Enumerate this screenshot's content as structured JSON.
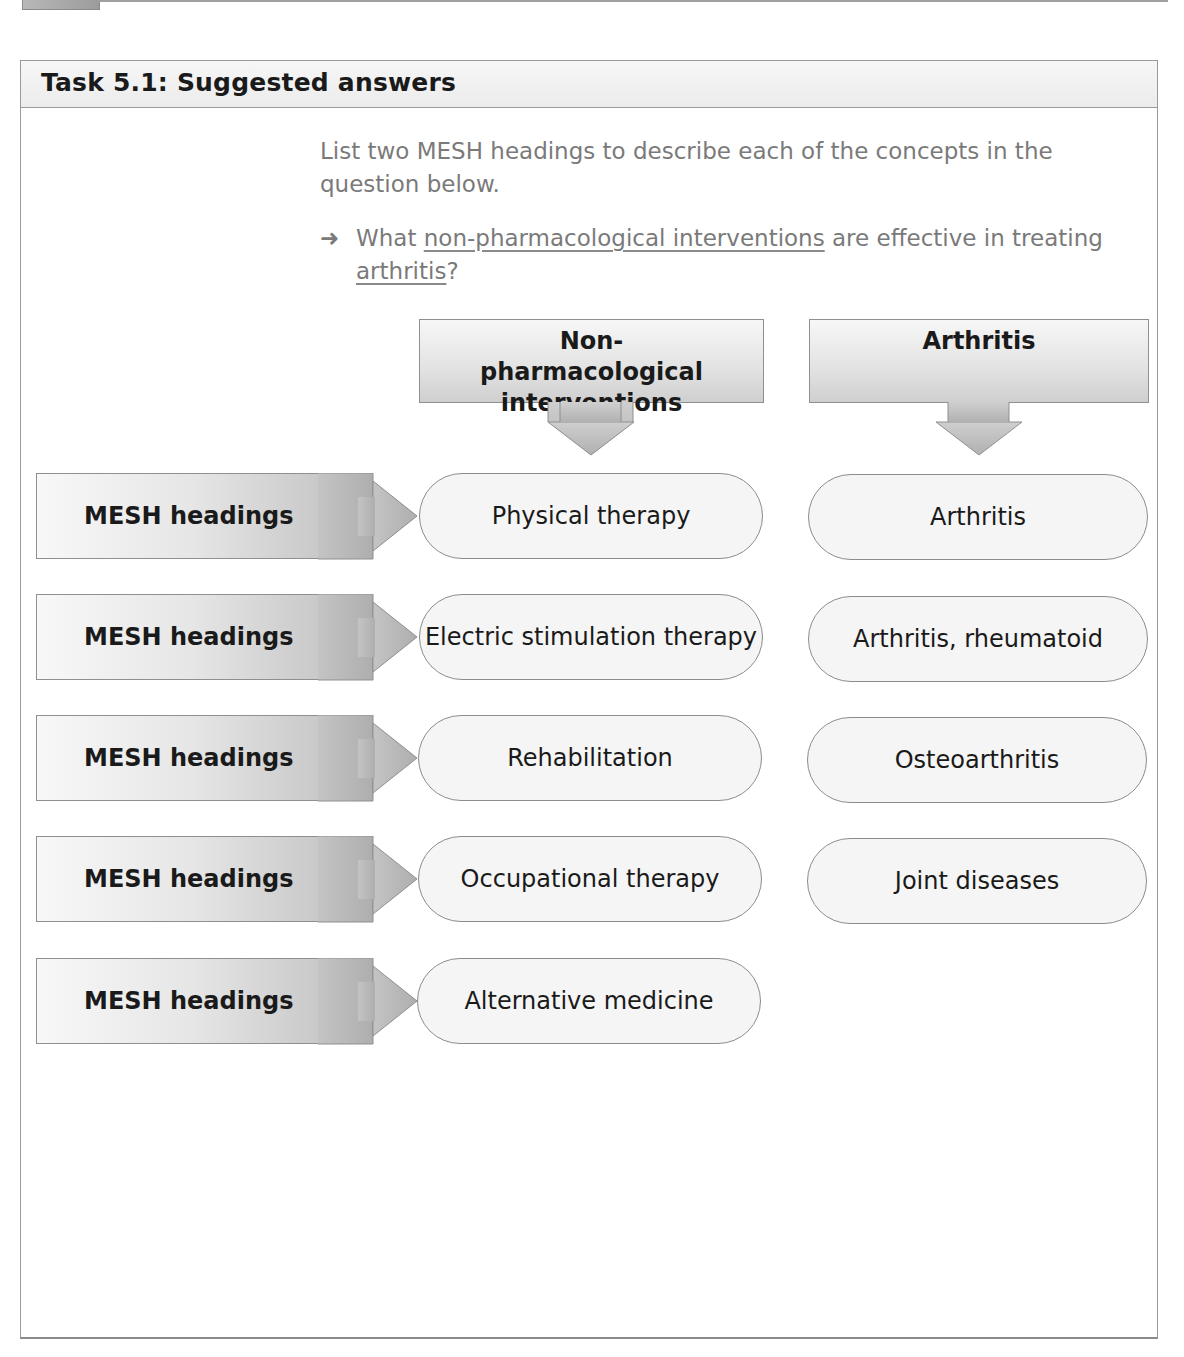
{
  "panel": {
    "title": "Task 5.1: Suggested answers"
  },
  "instructions": {
    "intro": "List two MESH headings to describe each of the concepts in the question below.",
    "question_prefix": "What ",
    "question_concept_1": "non-pharmacological interventions",
    "question_middle": " are effective in treating ",
    "question_concept_2": "arthritis",
    "question_suffix": "?",
    "bullet_icon": "right-arrow-icon"
  },
  "concepts": [
    {
      "label": "Non-pharmacological interventions",
      "mesh_headings": [
        "Physical therapy",
        "Electric stimulation therapy",
        "Rehabilitation",
        "Occupational therapy",
        "Alternative medicine"
      ]
    },
    {
      "label": "Arthritis",
      "mesh_headings": [
        "Arthritis",
        "Arthritis, rheumatoid",
        "Osteoarthritis",
        "Joint diseases"
      ]
    }
  ],
  "row_labels": [
    "MESH headings",
    "MESH headings",
    "MESH headings",
    "MESH headings",
    "MESH headings"
  ],
  "colors": {
    "arrow_fill": "#b9b9b9",
    "arrow_stroke": "#8f8f8f",
    "pill_fill": "#f5f5f5",
    "intro_text": "#7a7a7a"
  }
}
